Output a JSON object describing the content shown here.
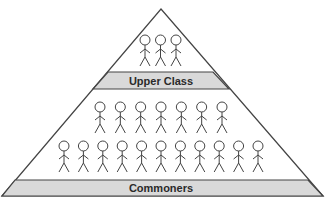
{
  "diagram": {
    "type": "social-hierarchy-pyramid",
    "colors": {
      "outline": "#444444",
      "band_fill": "#d9d9d9",
      "background": "#ffffff",
      "label_text": "#2a2a2a"
    },
    "tiers": [
      {
        "id": "upper-class",
        "label": "Upper Class",
        "rows": [
          {
            "figure_count": 3
          }
        ]
      },
      {
        "id": "commoners",
        "label": "Commoners",
        "rows": [
          {
            "figure_count": 7
          },
          {
            "figure_count": 11
          }
        ]
      }
    ],
    "total_figures": 21
  }
}
